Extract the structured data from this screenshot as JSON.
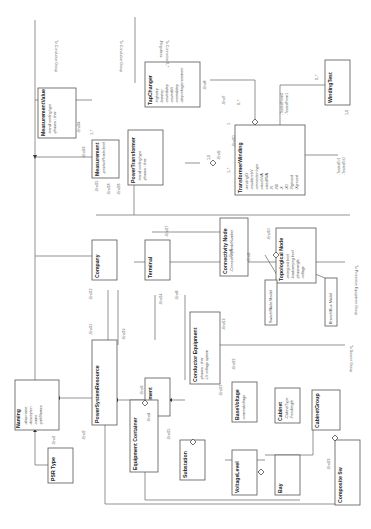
{
  "diagram": {
    "type": "UML class diagram",
    "orientation": "rotated 90 degrees counter-clockwise",
    "classes": [
      {
        "id": "naming",
        "name": "Naming",
        "attributes": [
          "-alias name",
          "-description",
          "-name",
          "-pathNames"
        ]
      },
      {
        "id": "psrtype",
        "name": "PSR Type",
        "attributes": []
      },
      {
        "id": "psr",
        "name": "PowerSystemResource",
        "attributes": []
      },
      {
        "id": "company",
        "name": "Company",
        "attributes": []
      },
      {
        "id": "equipment",
        "name": "Equipment",
        "attributes": []
      },
      {
        "id": "eqcontainer",
        "name": "Equipment Container",
        "attributes": []
      },
      {
        "id": "substation",
        "name": "Substation",
        "attributes": []
      },
      {
        "id": "voltagelevel",
        "name": "VoltageLevel",
        "attributes": []
      },
      {
        "id": "bay",
        "name": "Bay",
        "attributes": []
      },
      {
        "id": "basevoltage",
        "name": "BaseVoltage",
        "attributes": [
          "-nominalvoltage"
        ]
      },
      {
        "id": "condeq",
        "name": "Conductor Equipment",
        "attributes": [
          "-phases : char",
          "-LV voltage system"
        ]
      },
      {
        "id": "cabinet",
        "name": "Cabinet",
        "attributes": [
          "-CabinetType",
          "-Feedlength"
        ]
      },
      {
        "id": "cabinetgroup",
        "name": "CabinetGroup",
        "attributes": []
      },
      {
        "id": "compositesw",
        "name": "Composite Sw",
        "attributes": []
      },
      {
        "id": "terminal",
        "name": "Terminal",
        "attributes": []
      },
      {
        "id": "connnode",
        "name": "Connectivity Node",
        "attributes": [
          "-ConnectivityNodeNumber"
        ]
      },
      {
        "id": "topnode",
        "name": "Topological Node",
        "attributes": [
          "-energized bool",
          "-loadcarrying bool",
          "-phaseangle",
          "-voltage"
        ]
      },
      {
        "id": "measurement",
        "name": "Measurement",
        "attributes": [
          "-positiveFlowIn:bool"
        ]
      },
      {
        "id": "measvalue",
        "name": "MeasurementValue",
        "attributes": [
          "-transf cooling type",
          "-phases : char"
        ]
      },
      {
        "id": "powertrans",
        "name": "PowerTransformer",
        "attributes": [
          "-transf cooling type",
          "-phases : char"
        ]
      },
      {
        "id": "tapchanger",
        "name": "TapChanger",
        "attributes": [
          "-highstep",
          "-lowstep",
          "-neutralstep",
          "-neutralkV",
          "-normalstep",
          "-stepvoltageincrement"
        ]
      },
      {
        "id": "transwinding",
        "name": "TransformerWinding",
        "attributes": [
          "-windingID",
          "-insulationkV",
          "-connection type",
          "-rated kVA",
          "-ratedMVA",
          "-R",
          "-R0",
          "-X",
          "-X0",
          "-Rground",
          "-Xground"
        ]
      },
      {
        "id": "windingtest",
        "name": "WindingTest",
        "attributes": []
      }
    ],
    "notes": [
      {
        "id": "note-switch",
        "text": "Switch/Node Model"
      },
      {
        "id": "note-branch",
        "text": "Branch/Bus Model"
      }
    ],
    "external_refs": [
      {
        "id": "ref1",
        "text": "To Conductor Group"
      },
      {
        "id": "ref2",
        "text": "To Conductor Group"
      },
      {
        "id": "ref3",
        "text": "To Connector Lind Group"
      },
      {
        "id": "ref4",
        "text": "To Protection Equipment Group"
      },
      {
        "id": "ref5",
        "text": "To Source Group"
      },
      {
        "id": "ref6",
        "text": "To Switch Group"
      }
    ],
    "labels": {
      "regulates": "-Regulates",
      "zero_many": "0..*",
      "one": "1",
      "zero_one": "0..1",
      "one_many": "1..*",
      "one_zero": "1,0",
      "end1": "-End1",
      "end2": "-End2",
      "end3": "-End3",
      "end4": "-End4",
      "end5": "-End5",
      "end6": "-End6",
      "end7": "-End7",
      "end8": "-End8",
      "end9": "-End9",
      "end10": "-End10",
      "end11": "-End11",
      "end12": "-End12",
      "end13": "-End13",
      "end14": "-End14",
      "end15": "-End15",
      "end16": "-End16",
      "end17": "-End17",
      "end18": "-End18",
      "end19": "-End19",
      "end20": "-End20",
      "end21": "-End21",
      "end22": "-End22",
      "end23": "-End23",
      "end24": "-End24",
      "end25": "-End25",
      "end26": "-End26",
      "end33": "-End33",
      "end34": "-End34",
      "tested_from0": "-TestedFrom0",
      "tested_from1": "-TestedFrom1",
      "tested_to1": "-TestedTo1",
      "tested_to0": "-TestedTo0"
    }
  }
}
